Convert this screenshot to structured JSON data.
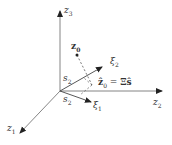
{
  "diagram": {
    "type": "3d-coordinate-projection",
    "axes": {
      "z1": {
        "symbol": "z",
        "index": "1"
      },
      "z2": {
        "symbol": "z",
        "index": "2"
      },
      "z3": {
        "symbol": "z",
        "index": "3"
      }
    },
    "vectors": {
      "xi1": {
        "symbol": "ξ",
        "index": "1"
      },
      "xi2": {
        "symbol": "ξ",
        "index": "2"
      }
    },
    "point": {
      "symbol": "z",
      "index": "0"
    },
    "projection": {
      "lhs_symbol": "ẑ",
      "lhs_index": "0",
      "equals": "=",
      "rhs": "Ξŝ"
    },
    "angle_labels": {
      "upper": {
        "symbol": "s",
        "index": "2"
      },
      "lower": {
        "symbol": "s",
        "index": "2"
      }
    },
    "colors": {
      "axis": "#555555",
      "vector": "#333333",
      "dashed": "#444444",
      "point": "#222222"
    }
  }
}
